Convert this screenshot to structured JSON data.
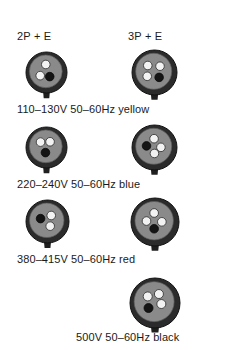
{
  "page": {
    "background": "#ffffff",
    "text_color": "#1a1a1a",
    "width": 231,
    "height": 350
  },
  "columns": [
    {
      "id": "2p-e",
      "label": "2P + E",
      "pole_count": 2,
      "has_earth": true
    },
    {
      "id": "3p-e",
      "label": "3P + E",
      "pole_count": 3,
      "has_earth": true
    }
  ],
  "connector_style": {
    "body_fill": "#8a8a8a",
    "rim_fill": "#2b2b2b",
    "rim_stroke": "#111111",
    "pin_live_fill": "#f2f2f2",
    "pin_live_stroke": "#2b2b2b",
    "pin_earth_fill": "#141414",
    "pin_earth_stroke": "#0a0a0a",
    "keyway_fill": "#1f1f1f"
  },
  "rows": [
    {
      "id": "yellow",
      "caption": "110–130V 50–60Hz yellow",
      "voltage": "110–130V",
      "frequency": "50–60Hz",
      "colour_code": "yellow",
      "connectors": [
        {
          "column": "2P + E",
          "diameter": 41,
          "pins": [
            {
              "role": "live",
              "x": 0,
              "y": -0.42,
              "r": 0.105
            },
            {
              "role": "live",
              "x": -0.34,
              "y": 0.26,
              "r": 0.105
            },
            {
              "role": "earth",
              "x": 0.24,
              "y": 0.32,
              "r": 0.105
            }
          ]
        },
        {
          "column": "3P + E",
          "diameter": 45,
          "pins": [
            {
              "role": "live",
              "x": -0.33,
              "y": -0.32,
              "r": 0.095
            },
            {
              "role": "live",
              "x": 0.35,
              "y": -0.28,
              "r": 0.095
            },
            {
              "role": "live",
              "x": -0.36,
              "y": 0.28,
              "r": 0.095
            },
            {
              "role": "earth",
              "x": 0.3,
              "y": 0.34,
              "r": 0.095
            }
          ]
        }
      ]
    },
    {
      "id": "blue",
      "caption": "220–240V 50–60Hz blue",
      "voltage": "220–240V",
      "frequency": "50–60Hz",
      "colour_code": "blue",
      "connectors": [
        {
          "column": "2P + E",
          "diameter": 41,
          "pins": [
            {
              "role": "live",
              "x": -0.32,
              "y": -0.26,
              "r": 0.105
            },
            {
              "role": "live",
              "x": 0.26,
              "y": -0.28,
              "r": 0.105
            },
            {
              "role": "earth",
              "x": -0.02,
              "y": 0.38,
              "r": 0.105
            }
          ]
        },
        {
          "column": "3P + E",
          "diameter": 45,
          "pins": [
            {
              "role": "live",
              "x": 0.02,
              "y": -0.42,
              "r": 0.095
            },
            {
              "role": "earth",
              "x": -0.4,
              "y": -0.02,
              "r": 0.095
            },
            {
              "role": "live",
              "x": 0.4,
              "y": 0.06,
              "r": 0.095
            },
            {
              "role": "live",
              "x": 0.04,
              "y": 0.4,
              "r": 0.095
            }
          ]
        }
      ]
    },
    {
      "id": "red",
      "caption": "380–415V 50–60Hz red",
      "voltage": "380–415V",
      "frequency": "50–60Hz",
      "colour_code": "red",
      "connectors": [
        {
          "column": "2P + E",
          "diameter": 43,
          "pins": [
            {
              "role": "earth",
              "x": -0.36,
              "y": -0.1,
              "r": 0.1
            },
            {
              "role": "live",
              "x": 0.26,
              "y": -0.28,
              "r": 0.1
            },
            {
              "role": "live",
              "x": 0.2,
              "y": 0.34,
              "r": 0.1
            }
          ]
        },
        {
          "column": "3P + E",
          "diameter": 48,
          "pins": [
            {
              "role": "live",
              "x": 0.0,
              "y": -0.4,
              "r": 0.09
            },
            {
              "role": "live",
              "x": -0.4,
              "y": 0.02,
              "r": 0.09
            },
            {
              "role": "live",
              "x": 0.4,
              "y": 0.06,
              "r": 0.09
            },
            {
              "role": "earth",
              "x": 0.0,
              "y": 0.42,
              "r": 0.09
            }
          ]
        }
      ]
    },
    {
      "id": "black",
      "caption": "500V 50–60Hz black",
      "voltage": "500V",
      "frequency": "50–60Hz",
      "colour_code": "black",
      "connectors": [
        {
          "column": "3P + E",
          "diameter": 50,
          "pins": [
            {
              "role": "live",
              "x": -0.32,
              "y": -0.26,
              "r": 0.09
            },
            {
              "role": "live",
              "x": 0.24,
              "y": -0.38,
              "r": 0.09
            },
            {
              "role": "live",
              "x": 0.36,
              "y": 0.12,
              "r": 0.09
            },
            {
              "role": "earth",
              "x": -0.28,
              "y": 0.32,
              "r": 0.09
            }
          ]
        }
      ]
    }
  ]
}
